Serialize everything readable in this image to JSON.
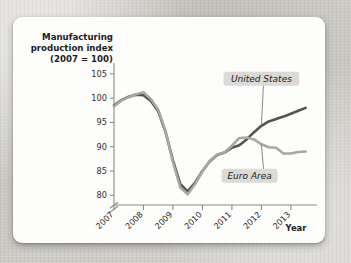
{
  "figure": {
    "title_line1": "Manufacturing",
    "title_line2": "production index",
    "title_line3": "(2007 = 100)",
    "x_axis_name": "Year",
    "colors": {
      "united_states": "#55534f",
      "euro_area": "#a9a7a2",
      "axis": "#8d8b87",
      "callout_bg": "#dcdad6",
      "card_bg": "#fdfdfc",
      "page_bg": "#cfcdc8"
    }
  },
  "chart_data": {
    "type": "line",
    "title": "Manufacturing production index (2007 = 100)",
    "subtitle": "",
    "xlabel": "Year",
    "ylabel": "Manufacturing production index (2007 = 100)",
    "xlim": [
      2007,
      2013.75
    ],
    "ylim": [
      78,
      106
    ],
    "yticks": [
      80,
      85,
      90,
      95,
      100,
      105
    ],
    "ytick_labels": [
      "80",
      "85",
      "90",
      "95",
      "100",
      "105"
    ],
    "xticks": [
      2007,
      2008,
      2009,
      2010,
      2011,
      2012,
      2013
    ],
    "xtick_labels": [
      "2007",
      "2008",
      "2009",
      "2010",
      "2011",
      "2012",
      "2013"
    ],
    "y_axis_break": true,
    "y_axis_break_below": 80,
    "grid": false,
    "legend": "inline-callouts",
    "annotations": [
      {
        "text": "United States",
        "series": "United States",
        "x": 2012.0,
        "y": 104.0,
        "italic": true,
        "boxed": true
      },
      {
        "text": "Euro Area",
        "series": "Euro Area",
        "x": 2011.6,
        "y": 84.0,
        "italic": true,
        "boxed": true
      }
    ],
    "series": [
      {
        "name": "United States",
        "color": "#55534f",
        "x": [
          2007.0,
          2007.25,
          2007.5,
          2007.75,
          2008.0,
          2008.25,
          2008.5,
          2008.75,
          2009.0,
          2009.25,
          2009.5,
          2009.75,
          2010.0,
          2010.25,
          2010.5,
          2010.75,
          2011.0,
          2011.25,
          2011.5,
          2011.75,
          2012.0,
          2012.25,
          2012.5,
          2012.75,
          2013.0,
          2013.25,
          2013.5
        ],
        "y": [
          98.5,
          99.6,
          100.3,
          100.7,
          100.6,
          99.4,
          97.3,
          93.0,
          87.2,
          82.3,
          80.8,
          82.6,
          85.0,
          87.0,
          88.3,
          88.8,
          89.8,
          90.3,
          91.5,
          93.0,
          94.3,
          95.2,
          95.7,
          96.2,
          96.8,
          97.4,
          98.0
        ]
      },
      {
        "name": "Euro Area",
        "color": "#a9a7a2",
        "x": [
          2007.0,
          2007.25,
          2007.5,
          2007.75,
          2008.0,
          2008.25,
          2008.5,
          2008.75,
          2009.0,
          2009.25,
          2009.5,
          2009.75,
          2010.0,
          2010.25,
          2010.5,
          2010.75,
          2011.0,
          2011.25,
          2011.5,
          2011.75,
          2012.0,
          2012.25,
          2012.5,
          2012.75,
          2013.0,
          2013.25,
          2013.5
        ],
        "y": [
          98.3,
          99.5,
          100.2,
          100.8,
          101.2,
          99.8,
          97.6,
          93.2,
          86.8,
          81.6,
          80.2,
          82.3,
          84.9,
          87.1,
          88.4,
          88.8,
          90.2,
          91.8,
          91.9,
          91.5,
          90.5,
          89.9,
          89.8,
          88.6,
          88.6,
          88.9,
          89.0
        ]
      }
    ]
  }
}
